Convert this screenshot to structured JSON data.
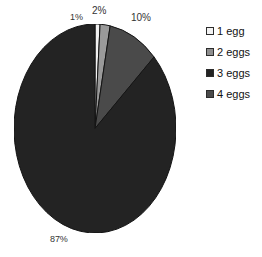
{
  "chart_data": {
    "type": "pie",
    "title": "",
    "xlabel": "",
    "ylabel": "",
    "grid": false,
    "legend_position": "right",
    "categories": [
      "1 egg",
      "2 eggs",
      "3 eggs",
      "4 eggs"
    ],
    "values": [
      1,
      2,
      10,
      87
    ],
    "value_labels": [
      "1%",
      "2%",
      "10%",
      "87%"
    ],
    "unit": "%",
    "start_angle_deg": 0,
    "direction": "clockwise",
    "colors": [
      "#f2f2f2",
      "#9a9a9a",
      "#232323",
      "#4a4a4a"
    ],
    "slices": [
      {
        "label": "1 egg",
        "value": 1,
        "value_label": "1%",
        "color": "#f2f2f2"
      },
      {
        "label": "2 eggs",
        "value": 2,
        "value_label": "2%",
        "color": "#9a9a9a"
      },
      {
        "label": "4 eggs",
        "value": 10,
        "value_label": "10%",
        "color": "#4a4a4a"
      },
      {
        "label": "3 eggs",
        "value": 87,
        "value_label": "87%",
        "color": "#232323"
      }
    ]
  },
  "title_clip": {
    "text": ""
  },
  "labels": {
    "pct_1": "1%",
    "pct_2": "2%",
    "pct_10": "10%",
    "pct_87": "87%"
  },
  "legend": {
    "items": [
      {
        "label": "1 egg",
        "color": "#f2f2f2"
      },
      {
        "label": "2 eggs",
        "color": "#8e8e8e"
      },
      {
        "label": "3 eggs",
        "color": "#232323"
      },
      {
        "label": "4 eggs",
        "color": "#4a4a4a"
      }
    ]
  },
  "colors": {
    "background": "#ffffff",
    "text": "#1a1a1a",
    "slice_outline": "#141414"
  }
}
